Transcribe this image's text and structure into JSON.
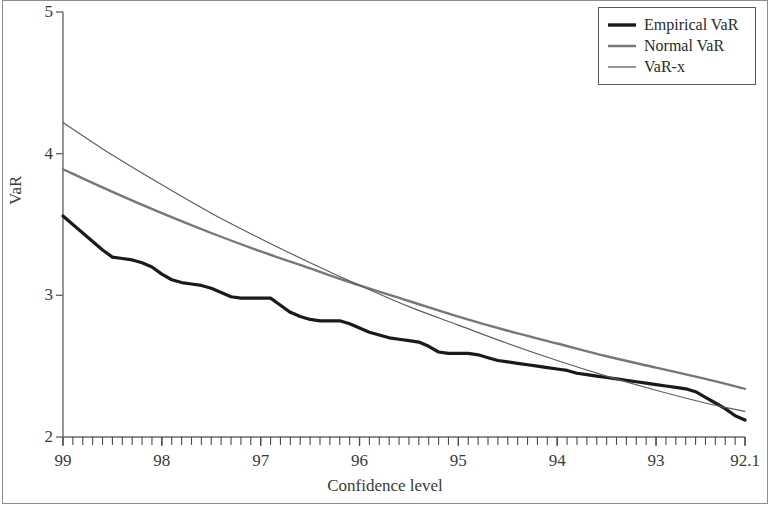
{
  "figure": {
    "frame_color": "#8d8d8d",
    "background": "#ffffff"
  },
  "axes": {
    "y_title": "VaR",
    "x_title": "Confidence level",
    "y_ticks": [
      "5",
      "4",
      "3",
      "2"
    ],
    "x_ticks": [
      "99",
      "98",
      "97",
      "96",
      "95",
      "94",
      "93",
      "92.1"
    ]
  },
  "legend": {
    "items": [
      {
        "label": "Empirical VaR",
        "color": "#1a1a1a",
        "width": 3.2
      },
      {
        "label": "Normal VaR",
        "color": "#777777",
        "width": 2.4
      },
      {
        "label": "VaR-x",
        "color": "#5e5e5e",
        "width": 1.2
      }
    ]
  },
  "chart_data": {
    "type": "line",
    "title": "",
    "xlabel": "Confidence level",
    "ylabel": "VaR",
    "xlim": [
      99,
      92.1
    ],
    "ylim": [
      2,
      5
    ],
    "x_tick_values": [
      99,
      98,
      97,
      96,
      95,
      94,
      93,
      92.1
    ],
    "y_tick_values": [
      2,
      3,
      4,
      5
    ],
    "x_minor_tick_count": 69,
    "grid": false,
    "legend_position": "top-right",
    "x_axis_direction": "decreasing",
    "series": [
      {
        "name": "Empirical VaR",
        "color": "#1a1a1a",
        "line_width": 3.2,
        "style": "jagged-empirical",
        "x": [
          99.0,
          98.9,
          98.8,
          98.7,
          98.6,
          98.5,
          98.4,
          98.3,
          98.2,
          98.1,
          98.0,
          97.9,
          97.8,
          97.7,
          97.6,
          97.5,
          97.4,
          97.3,
          97.2,
          97.1,
          97.0,
          96.9,
          96.8,
          96.7,
          96.6,
          96.5,
          96.4,
          96.3,
          96.2,
          96.1,
          96.0,
          95.9,
          95.8,
          95.7,
          95.6,
          95.5,
          95.4,
          95.3,
          95.2,
          95.1,
          95.0,
          94.9,
          94.8,
          94.7,
          94.6,
          94.5,
          94.4,
          94.3,
          94.2,
          94.1,
          94.0,
          93.9,
          93.8,
          93.7,
          93.6,
          93.5,
          93.4,
          93.3,
          93.2,
          93.1,
          93.0,
          92.9,
          92.8,
          92.7,
          92.6,
          92.5,
          92.4,
          92.3,
          92.2,
          92.1
        ],
        "y": [
          3.56,
          3.5,
          3.44,
          3.38,
          3.32,
          3.27,
          3.26,
          3.25,
          3.23,
          3.2,
          3.15,
          3.11,
          3.09,
          3.08,
          3.07,
          3.05,
          3.02,
          2.99,
          2.98,
          2.98,
          2.98,
          2.98,
          2.93,
          2.88,
          2.85,
          2.83,
          2.82,
          2.82,
          2.82,
          2.8,
          2.77,
          2.74,
          2.72,
          2.7,
          2.69,
          2.68,
          2.67,
          2.64,
          2.6,
          2.59,
          2.59,
          2.59,
          2.58,
          2.56,
          2.54,
          2.53,
          2.52,
          2.51,
          2.5,
          2.49,
          2.48,
          2.47,
          2.45,
          2.44,
          2.43,
          2.42,
          2.41,
          2.4,
          2.39,
          2.38,
          2.37,
          2.36,
          2.35,
          2.34,
          2.32,
          2.28,
          2.24,
          2.2,
          2.15,
          2.12
        ]
      },
      {
        "name": "Normal VaR",
        "color": "#777777",
        "line_width": 2.4,
        "style": "smooth",
        "x": [
          99.0,
          98.5,
          98.0,
          97.5,
          97.0,
          96.5,
          96.0,
          95.5,
          95.0,
          94.5,
          94.0,
          93.5,
          93.0,
          92.5,
          92.1
        ],
        "y": [
          3.89,
          3.73,
          3.58,
          3.44,
          3.31,
          3.19,
          3.07,
          2.96,
          2.85,
          2.75,
          2.66,
          2.57,
          2.49,
          2.41,
          2.34
        ]
      },
      {
        "name": "VaR-x",
        "color": "#5e5e5e",
        "line_width": 1.2,
        "style": "smooth",
        "x": [
          99.0,
          98.5,
          98.0,
          97.5,
          97.0,
          96.5,
          96.0,
          95.5,
          95.0,
          94.5,
          94.0,
          93.5,
          93.0,
          92.5,
          92.1
        ],
        "y": [
          4.22,
          3.99,
          3.78,
          3.58,
          3.4,
          3.23,
          3.07,
          2.92,
          2.79,
          2.66,
          2.54,
          2.43,
          2.33,
          2.24,
          2.18
        ]
      }
    ]
  }
}
